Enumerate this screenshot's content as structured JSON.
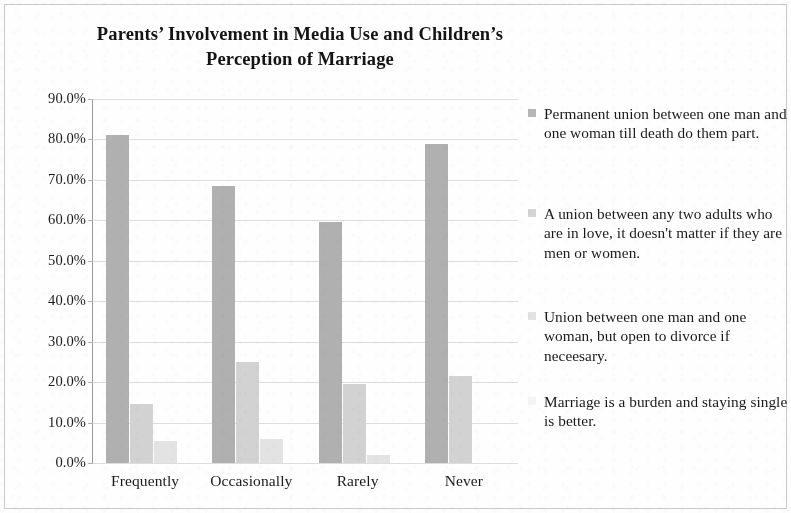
{
  "chart_data": {
    "type": "bar",
    "title": "Parents’ Involvement in Media Use and Children’s Perception of Marriage",
    "title_line1": "Parents’ Involvement in Media Use and Children’s",
    "title_line2": "Perception of Marriage",
    "xlabel": "",
    "ylabel": "",
    "ylim": [
      0,
      90
    ],
    "ytick_step": 10,
    "grid": true,
    "legend_position": "right",
    "categories": [
      "Frequently",
      "Occasionally",
      "Rarely",
      "Never"
    ],
    "ytick_labels": [
      "0.0%",
      "10.0%",
      "20.0%",
      "30.0%",
      "40.0%",
      "50.0%",
      "60.0%",
      "70.0%",
      "80.0%",
      "90.0%"
    ],
    "series": [
      {
        "name": "Permanent union between one man and one woman till death do them part.",
        "color": "#b0b0b0",
        "values": [
          81.0,
          68.5,
          59.5,
          79.0
        ]
      },
      {
        "name": "A union between any two adults who are in love, it doesn't matter if they are men or women.",
        "color": "#d2d2d2",
        "values": [
          14.5,
          25.0,
          19.5,
          21.5
        ]
      },
      {
        "name": "Union between one man and one woman, but open to divorce if neceesary.",
        "color": "#e3e3e3",
        "values": [
          5.5,
          6.0,
          2.0,
          0.0
        ]
      },
      {
        "name": "Marriage is a burden and staying single is better.",
        "color": "#f3f3f3",
        "values": [
          0.0,
          0.0,
          0.0,
          0.0
        ]
      }
    ]
  },
  "legend": {
    "items": [
      {
        "label": "Permanent union between one man and one woman till death do them part.",
        "swatch": "#b6b6b6"
      },
      {
        "label": "A union between any two adults who are in love, it doesn't matter if they are men or women.",
        "swatch": "#d4d4d4"
      },
      {
        "label": "Union between one man and one woman, but open to divorce if neceesary.",
        "swatch": "#e2e2e2"
      },
      {
        "label": "Marriage is a burden and staying single is better.",
        "swatch": "#f4f4f4"
      }
    ]
  }
}
